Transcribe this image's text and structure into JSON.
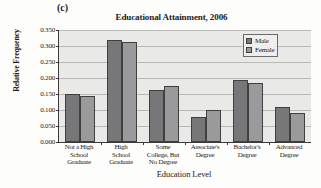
{
  "panel_label": "(c)",
  "chart_data": {
    "type": "bar",
    "title": "Educational Attainment, 2006",
    "xlabel": "Education Level",
    "ylabel": "Relative Frequency",
    "ylim": [
      0.0,
      0.35
    ],
    "yticks": [
      "0.000",
      "0.050",
      "0.100",
      "0.150",
      "0.200",
      "0.250",
      "0.300",
      "0.350"
    ],
    "ytick_values": [
      0.0,
      0.05,
      0.1,
      0.15,
      0.2,
      0.25,
      0.3,
      0.35
    ],
    "grid": true,
    "legend_position": "top-right",
    "categories": [
      "Not a High\nSchool\nGraduate",
      "High\nSchool\nGraduate",
      "Some\nCollege, But\nNo Degree",
      "Associate's\nDegree",
      "Bachelor's\nDegree",
      "Advanced\nDegree"
    ],
    "category_lines": [
      [
        "Not a High",
        "School",
        "Graduate"
      ],
      [
        "High",
        "School",
        "Graduate"
      ],
      [
        "Some",
        "College, But",
        "No Degree"
      ],
      [
        "Associate's",
        "Degree"
      ],
      [
        "Bachelor's",
        "Degree"
      ],
      [
        "Advanced",
        "Degree"
      ]
    ],
    "series": [
      {
        "name": "Male",
        "color": "#77777a",
        "values": [
          0.151,
          0.318,
          0.162,
          0.078,
          0.193,
          0.11
        ]
      },
      {
        "name": "Female",
        "color": "#9a9a9c",
        "values": [
          0.144,
          0.314,
          0.175,
          0.1,
          0.185,
          0.091
        ]
      }
    ]
  }
}
